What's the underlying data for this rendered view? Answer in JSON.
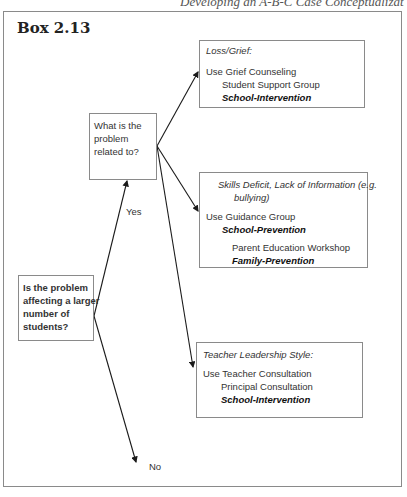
{
  "page": {
    "running_head": "Developing an A-B-C Case Conceptualization   55"
  },
  "box": {
    "title": "Box 2.13"
  },
  "nodes": {
    "start": {
      "lines": [
        "Is the problem",
        "affecting a larger",
        "number of",
        "students?"
      ]
    },
    "question": {
      "lines": [
        "What is the",
        "problem",
        "related to?"
      ]
    },
    "loss": {
      "heading": "Loss/Grief:",
      "line1": "Use Grief Counseling",
      "line2": "Student Support Group",
      "line3": "School-Intervention"
    },
    "skills": {
      "heading1": "Skills Deficit, Lack of Information (e.g.",
      "heading2": "bullying)",
      "line1": "Use Guidance Group",
      "line2": "School-Prevention",
      "line3": "Parent Education Workshop",
      "line4": "Family-Prevention"
    },
    "teacher": {
      "heading": "Teacher  Leadership Style:",
      "line1": "Use Teacher Consultation",
      "line2": "Principal Consultation",
      "line3": "School-Intervention"
    }
  },
  "labels": {
    "yes": "Yes",
    "no": "No"
  },
  "colors": {
    "border": "#8a8a8a",
    "arrow": "#1a1a1a"
  }
}
